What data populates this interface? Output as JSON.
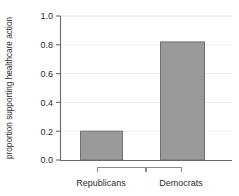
{
  "chart_data": {
    "type": "bar",
    "title": "",
    "xlabel": "",
    "ylabel": "proportion supporting healthcare action",
    "categories": [
      "Republicans",
      "Democrats"
    ],
    "values": [
      0.2,
      0.82
    ],
    "series": [
      {
        "name": "proportion supporting healthcare action",
        "values": [
          0.2,
          0.82
        ]
      }
    ],
    "ylim": [
      0.0,
      1.0
    ],
    "yticks": [
      0.0,
      0.2,
      0.4,
      0.6,
      0.8,
      1.0
    ],
    "ytick_labels": [
      "0.0",
      "0.2",
      "0.4",
      "0.6",
      "0.8",
      "1.0"
    ],
    "grid": true,
    "grid_axis": "y",
    "legend": false,
    "legend_position": "none",
    "bar_fill_color": "#9a9a9a",
    "bar_edge_color": "#6e6e6e",
    "grid_color": "#e9e9e9",
    "axis_color": "#6b6b6b",
    "text_color": "#2b2b2b",
    "background_color": "#ffffff",
    "annotations": []
  },
  "axis": {
    "y_title": "proportion supporting healthcare action",
    "tick_0": "0.0",
    "tick_1": "0.2",
    "tick_2": "0.4",
    "tick_3": "0.6",
    "tick_4": "0.8",
    "tick_5": "1.0"
  },
  "categories": {
    "left_label": "Republicans",
    "right_label": "Democrats"
  }
}
